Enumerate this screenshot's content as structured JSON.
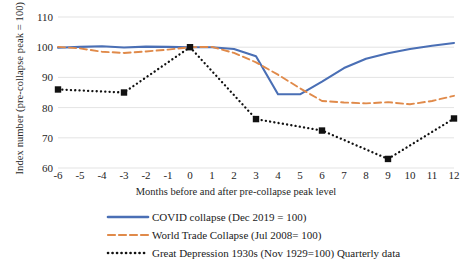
{
  "chart_data": {
    "type": "line",
    "title": "",
    "xlabel": "Months before and after pre-collapse peak level",
    "ylabel": "Index number (pre-collapse peak = 100)",
    "x": [
      -6,
      -5,
      -4,
      -3,
      -2,
      -1,
      0,
      1,
      2,
      3,
      4,
      5,
      6,
      7,
      8,
      9,
      10,
      11,
      12
    ],
    "xticklabels": [
      "-6",
      "-5",
      "-4",
      "-3",
      "-2",
      "-1",
      "0",
      "1",
      "2",
      "3",
      "4",
      "5",
      "6",
      "7",
      "8",
      "9",
      "10",
      "11",
      "12"
    ],
    "xlim": [
      -6,
      12
    ],
    "ylim": [
      60,
      110
    ],
    "yticks": [
      60,
      70,
      80,
      90,
      100,
      110
    ],
    "yticklabels": [
      "60",
      "70",
      "80",
      "90",
      "100",
      "110"
    ],
    "grid": "horizontal",
    "legend_position": "bottom",
    "series": [
      {
        "name": "COVID collapse (Dec 2019 = 100)",
        "style": "solid",
        "color": "#4a6fb5",
        "marker": "none",
        "x": [
          -6,
          -5,
          -4,
          -3,
          -2,
          -1,
          0,
          1,
          2,
          3,
          4,
          5,
          6,
          7,
          8,
          9,
          10,
          11,
          12
        ],
        "values": [
          99.8,
          100.1,
          100.3,
          99.9,
          100.2,
          100.1,
          100.0,
          100.0,
          99.4,
          97.0,
          84.4,
          84.4,
          88.6,
          93.1,
          96.2,
          98.0,
          99.4,
          100.5,
          101.4
        ]
      },
      {
        "name": "World Trade Collapse (Jul 2008= 100)",
        "style": "dashed",
        "color": "#e08a4a",
        "marker": "none",
        "x": [
          -6,
          -5,
          -4,
          -3,
          -2,
          -1,
          0,
          1,
          2,
          3,
          4,
          5,
          6,
          7,
          8,
          9,
          10,
          11,
          12
        ],
        "values": [
          100.1,
          99.6,
          98.5,
          98.1,
          98.6,
          99.2,
          100.0,
          100.1,
          98.1,
          95.0,
          90.9,
          86.4,
          82.2,
          81.7,
          81.4,
          81.8,
          81.1,
          82.2,
          83.9
        ]
      },
      {
        "name": "Great Depression 1930s (Nov 1929=100) Quarterly data",
        "style": "dotted",
        "color": "#111111",
        "marker": "square",
        "x": [
          -6,
          -3,
          0,
          3,
          6,
          9,
          12
        ],
        "values": [
          86.0,
          85.0,
          100.0,
          76.2,
          72.4,
          63.0,
          76.4
        ]
      }
    ]
  },
  "legend": {
    "items": [
      {
        "label": "COVID collapse (Dec 2019 = 100)",
        "key": "solid-line-key"
      },
      {
        "label": "World Trade Collapse (Jul 2008= 100)",
        "key": "dashed-line-key"
      },
      {
        "label": "Great Depression 1930s (Nov 1929=100) Quarterly data",
        "key": "dotted-line-key"
      }
    ]
  }
}
